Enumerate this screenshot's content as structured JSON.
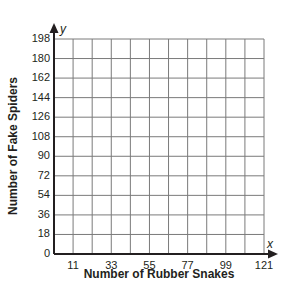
{
  "chart_data": {
    "type": "line",
    "title": "",
    "xlabel": "Number of Rubber Snakes",
    "ylabel": "Number of Fake Spiders",
    "x_var": "x",
    "y_var": "y",
    "x_ticks": [
      "11",
      "33",
      "55",
      "77",
      "99",
      "121"
    ],
    "y_ticks": [
      "0",
      "18",
      "36",
      "54",
      "72",
      "90",
      "108",
      "126",
      "144",
      "162",
      "180",
      "198"
    ],
    "xlim": [
      0,
      121
    ],
    "ylim": [
      0,
      198
    ],
    "grid": true,
    "grid_columns": 11,
    "grid_rows": 11,
    "series": [],
    "legend": null
  },
  "colors": {
    "grid": "#7a7a7a",
    "axis": "#231f20",
    "text": "#231f20"
  }
}
